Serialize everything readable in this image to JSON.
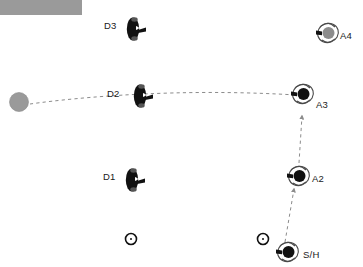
{
  "figure": {
    "title": "",
    "width": 363,
    "height": 267,
    "background_color": "#ffffff"
  },
  "colors": {
    "defender_body": "#111111",
    "attacker_body": "#111111",
    "attacker_gray_body": "#8c8c8c",
    "target_circle": "#9a9a9a",
    "top_bar": "#9a9a9a",
    "trajectory": "#8c8c8c",
    "marker_outline": "#111111",
    "label_text": "#1a1a1a"
  },
  "top_bar": {
    "name": "header-bar",
    "x": 0,
    "y": 0,
    "width": 82,
    "height": 15,
    "color": "#9a9a9a"
  },
  "target": {
    "name": "target-disc",
    "label": "",
    "x": 19,
    "y": 102,
    "radius": 9.5,
    "color": "#9a9a9a"
  },
  "agents": [
    {
      "id": "D3",
      "label": "D3",
      "kind": "defender",
      "x": 133,
      "y": 29,
      "body_color": "#111111",
      "label_x": 104,
      "label_y": 21,
      "orientation_deg": 0
    },
    {
      "id": "D2",
      "label": "D2",
      "kind": "defender",
      "x": 140,
      "y": 96,
      "body_color": "#111111",
      "label_x": 107,
      "label_y": 89,
      "orientation_deg": 0
    },
    {
      "id": "D1",
      "label": "D1",
      "kind": "defender",
      "x": 132,
      "y": 180,
      "body_color": "#111111",
      "label_x": 103,
      "label_y": 172,
      "orientation_deg": 0
    },
    {
      "id": "A4",
      "label": "A4",
      "kind": "attacker",
      "x": 328,
      "y": 33,
      "body_color": "#8c8c8c",
      "label_x": 340,
      "label_y": 31,
      "orientation_deg": 0
    },
    {
      "id": "A3",
      "label": "A3",
      "kind": "attacker",
      "x": 303,
      "y": 94,
      "body_color": "#111111",
      "label_x": 316,
      "label_y": 100,
      "orientation_deg": 0
    },
    {
      "id": "A2",
      "label": "A2",
      "kind": "attacker",
      "x": 299,
      "y": 176,
      "body_color": "#111111",
      "label_x": 312,
      "label_y": 174,
      "orientation_deg": 0
    },
    {
      "id": "SH",
      "label": "S/H",
      "kind": "attacker",
      "x": 288,
      "y": 252,
      "body_color": "#111111",
      "label_x": 303,
      "label_y": 250,
      "orientation_deg": 0
    }
  ],
  "markers": [
    {
      "name": "waypoint-marker-left",
      "x": 131,
      "y": 239,
      "radius": 5.5
    },
    {
      "name": "waypoint-marker-right",
      "x": 263,
      "y": 239,
      "radius": 5.5
    }
  ],
  "trajectories": [
    {
      "name": "target-trajectory",
      "style": "dashed",
      "color": "#8c8c8c",
      "path": "M 30 104 C 80 97, 180 88, 296 95",
      "arrowhead": false
    },
    {
      "name": "attacker-path-sh-to-a2",
      "style": "dashed",
      "color": "#8c8c8c",
      "path": "M 285 242 L 294 189",
      "arrowhead": true
    },
    {
      "name": "attacker-path-a2-to-a3",
      "style": "dashed",
      "color": "#8c8c8c",
      "path": "M 299 163 L 302 116",
      "arrowhead": true
    }
  ]
}
